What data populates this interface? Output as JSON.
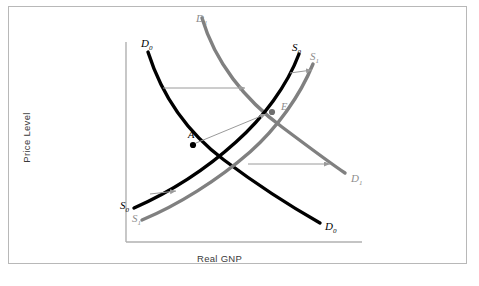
{
  "figure": {
    "kind": "supply-demand-diagram",
    "background_color": "#ffffff",
    "border_color": "#b8b8b8"
  },
  "axes": {
    "y_label": "Price Level",
    "x_label": "Real GNP",
    "axis_color": "#b0b0b0"
  },
  "colors": {
    "original_curve": "#000000",
    "shifted_curve": "#808080",
    "arrow": "#9a9a9a",
    "point_fill": "#000000",
    "point_fill_new": "#6e6e6e"
  },
  "curves": [
    {
      "id": "demand-original",
      "name": "D0",
      "color": "#000000",
      "role": "original demand",
      "label_start": {
        "text": "D",
        "sub": "0"
      },
      "label_end": {
        "text": "D",
        "sub": "0"
      }
    },
    {
      "id": "demand-shifted",
      "name": "D1",
      "color": "#808080",
      "role": "shifted demand",
      "label_start": {
        "text": "D",
        "sub": "1"
      },
      "label_end": {
        "text": "D",
        "sub": "1"
      }
    },
    {
      "id": "supply-original",
      "name": "S0",
      "color": "#000000",
      "role": "original supply",
      "label_start": {
        "text": "S",
        "sub": "0"
      },
      "label_end": {
        "text": "S",
        "sub": "0"
      }
    },
    {
      "id": "supply-shifted",
      "name": "S1",
      "color": "#808080",
      "role": "shifted supply",
      "label_start": {
        "text": "S",
        "sub": "1"
      },
      "label_end": {
        "text": "S",
        "sub": "1"
      }
    }
  ],
  "labels": {
    "demand0_top": {
      "letter": "D",
      "sub": "0"
    },
    "demand1_top": {
      "letter": "D",
      "sub": "1"
    },
    "demand1_right": {
      "letter": "D",
      "sub": "1"
    },
    "demand0_right": {
      "letter": "D",
      "sub": "0"
    },
    "supply0_top": {
      "letter": "S",
      "sub": "0"
    },
    "supply1_top": {
      "letter": "S",
      "sub": "1"
    },
    "supply0_bottom": {
      "letter": "S",
      "sub": "0"
    },
    "supply1_bottom": {
      "letter": "S",
      "sub": "1"
    }
  },
  "points": [
    {
      "id": "point-a",
      "label": "A",
      "role": "initial equilibrium",
      "color": "#000000"
    },
    {
      "id": "point-e",
      "label": "E",
      "role": "new equilibrium",
      "color": "#8d8d8d"
    }
  ],
  "arrows": [
    {
      "id": "demand-shift-upper",
      "direction": "right",
      "meaning": "demand curve shifts right"
    },
    {
      "id": "demand-shift-lower",
      "direction": "right",
      "meaning": "demand curve shifts right"
    },
    {
      "id": "supply-shift-lower",
      "direction": "right",
      "meaning": "supply curve shifts right"
    },
    {
      "id": "supply-shift-upper",
      "direction": "right",
      "meaning": "supply curve shifts right"
    },
    {
      "id": "equilibrium-move",
      "direction": "up-right",
      "meaning": "equilibrium moves from A to E"
    }
  ]
}
